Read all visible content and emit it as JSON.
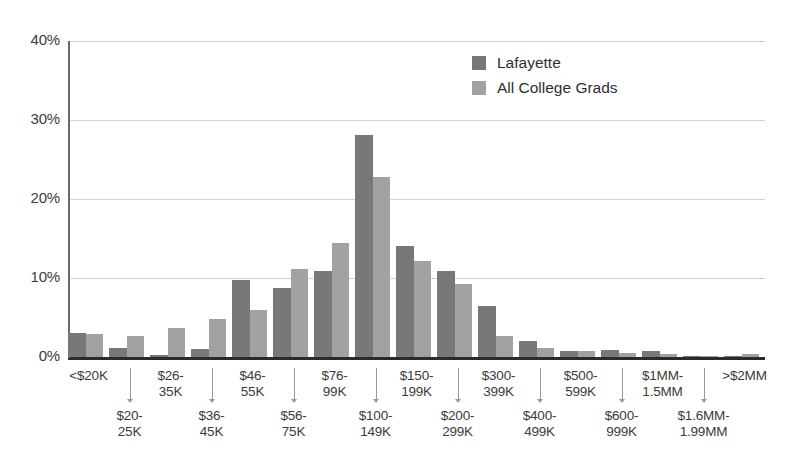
{
  "chart_data": {
    "type": "bar",
    "title": "",
    "subtitle": "",
    "xlabel": "",
    "ylabel": "",
    "ylim": [
      0,
      40
    ],
    "yticks": [
      "0%",
      "10%",
      "20%",
      "30%",
      "40%"
    ],
    "ytick_values": [
      0,
      10,
      20,
      30,
      40
    ],
    "grid": true,
    "legend_position": "top-right",
    "categories": [
      "<$20K",
      "$20-\n25K",
      "$26-\n35K",
      "$36-\n45K",
      "$46-\n55K",
      "$56-\n75K",
      "$76-\n99K",
      "$100-\n149K",
      "$150-\n199K",
      "$200-\n299K",
      "$300-\n399K",
      "$400-\n499K",
      "$500-\n599K",
      "$600-\n999K",
      "$1MM-\n1.5MM",
      "$1.6MM-\n1.99MM",
      ">$2MM"
    ],
    "series": [
      {
        "name": "Lafayette",
        "color": "#787878",
        "values": [
          3.0,
          1.2,
          0.2,
          1.0,
          9.8,
          8.7,
          10.9,
          28.1,
          14.0,
          10.9,
          6.4,
          2.0,
          0.8,
          0.9,
          0.7,
          0.1,
          0.1
        ]
      },
      {
        "name": "All College Grads",
        "color": "#a2a2a2",
        "values": [
          2.9,
          2.6,
          3.7,
          4.8,
          6.0,
          11.2,
          14.4,
          22.8,
          12.2,
          9.3,
          2.6,
          1.1,
          0.7,
          0.5,
          0.4,
          0.1,
          0.4
        ]
      }
    ]
  },
  "legend": {
    "items": [
      {
        "label": "Lafayette",
        "color": "#787878"
      },
      {
        "label": "All College Grads",
        "color": "#a2a2a2"
      }
    ]
  },
  "axis": {
    "y_ticks": [
      "40%",
      "30%",
      "20%",
      "10%",
      "0%"
    ]
  }
}
